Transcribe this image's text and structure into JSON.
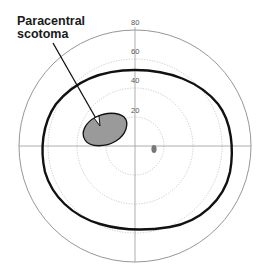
{
  "figure": {
    "type": "visual-field-perimetry-chart",
    "annotation": {
      "line1": "Paracentral",
      "line2": "scotoma"
    },
    "axis_labels": [
      "80",
      "60",
      "40",
      "20"
    ],
    "rings_degrees": [
      20,
      40,
      60,
      80
    ],
    "colors": {
      "field_boundary": "#111111",
      "scotoma_fill": "#9a9a9a",
      "blind_spot_fill": "#777777",
      "grid_ring": "#bbbbbb",
      "outer_ring": "#888888",
      "axis": "#999999"
    },
    "features": [
      {
        "name": "visual-field-boundary",
        "description": "bold isopter outline"
      },
      {
        "name": "paracentral-scotoma",
        "description": "gray shaded defect upper-left of fixation"
      },
      {
        "name": "blind-spot",
        "description": "small gray ellipse right of fixation"
      }
    ]
  }
}
